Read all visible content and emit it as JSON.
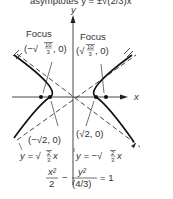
{
  "top_cut_text": "asymptotes y = ±√(2/3)x",
  "axes": {
    "x_label": "x",
    "y_label": "y"
  },
  "foci": {
    "left": {
      "title": "Focus",
      "coord_prefix": "(−√",
      "num": "10",
      "den": "3",
      "coord_suffix": ", 0)"
    },
    "right": {
      "title": "Focus",
      "coord_prefix": "(√",
      "num": "10",
      "den": "3",
      "coord_suffix": ", 0)"
    }
  },
  "vertices": {
    "left": "(−√2, 0)",
    "right": "(√2, 0)"
  },
  "asymptotes": {
    "left": {
      "prefix": "y = √",
      "num": "2",
      "den": "3",
      "suffix": "x"
    },
    "right": {
      "prefix": "y = −√",
      "num": "2",
      "den": "3",
      "suffix": "x"
    }
  },
  "equation": {
    "term1_num": "x²",
    "term1_den": "2",
    "minus": "−",
    "term2_num": "y²",
    "term2_den": "(4/3)",
    "rhs": "= 1"
  },
  "colors": {
    "ink": "#222222",
    "background": "#ffffff"
  }
}
